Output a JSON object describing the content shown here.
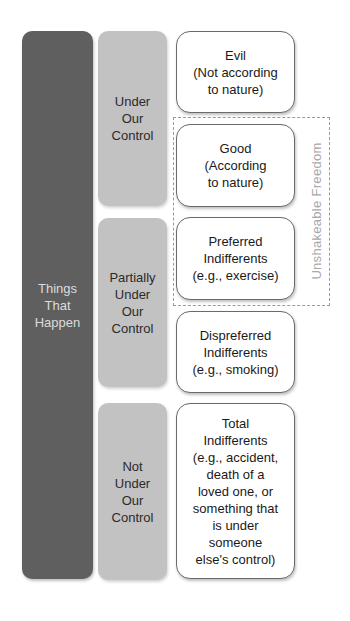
{
  "diagram": {
    "root": {
      "label": "Things\nThat\nHappen"
    },
    "control_categories": [
      {
        "label": "Under\nOur\nControl"
      },
      {
        "label": "Partially\nUnder\nOur\nControl"
      },
      {
        "label": "Not\nUnder\nOur\nControl"
      }
    ],
    "value_categories": [
      {
        "label": "Evil\n(Not according\nto nature)"
      },
      {
        "label": "Good\n(According\nto nature)"
      },
      {
        "label": "Preferred\nIndifferents\n(e.g., exercise)"
      },
      {
        "label": "Dispreferred\nIndifferents\n(e.g., smoking)"
      },
      {
        "label": "Total\nIndifferents\n(e.g., accident,\ndeath of a\nloved one, or\nsomething that\nis under\nsomeone\nelse's control)"
      }
    ],
    "grouping": {
      "label": "Unshakeable Freedom",
      "includes": [
        "Good",
        "Preferred Indifferents"
      ]
    }
  },
  "colors": {
    "root_fill": "#5f5f5f",
    "category_fill": "#c2c2c2",
    "value_fill": "#ffffff",
    "frame_stroke": "#9a9a9a"
  }
}
